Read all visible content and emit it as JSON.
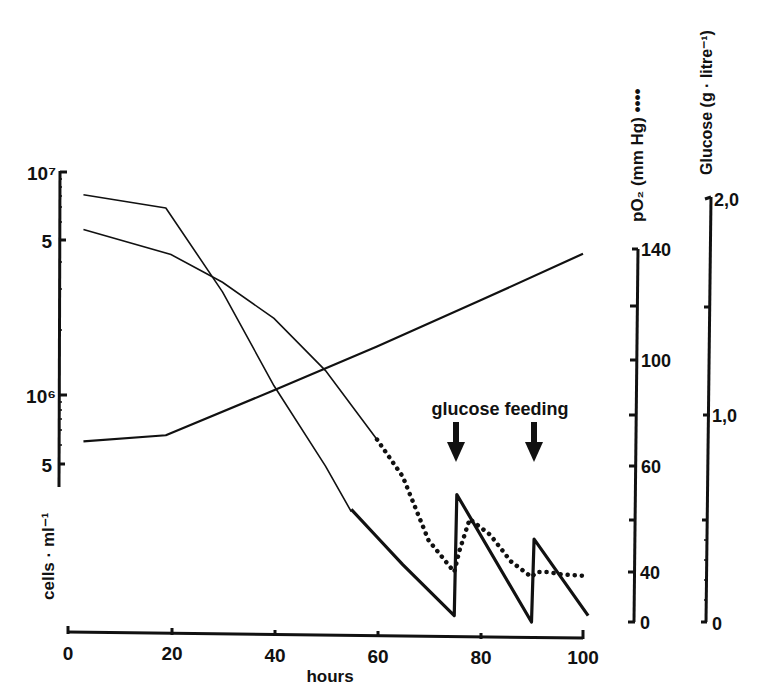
{
  "chart_data": {
    "type": "line",
    "title": "",
    "xlabel": "hours",
    "x_ticks": [
      0,
      20,
      40,
      60,
      80,
      100
    ],
    "xlim": [
      0,
      100
    ],
    "annotation": {
      "text": "glucose feeding",
      "arrows_at_hours": [
        75,
        90
      ]
    },
    "axes": {
      "left": {
        "label": "cells · ml⁻¹",
        "scale": "log",
        "ticks": [
          {
            "label": "10⁷",
            "value": 10000000
          },
          {
            "label": "5",
            "value": 5000000
          },
          {
            "label": "10⁶",
            "value": 1000000
          },
          {
            "label": "5",
            "value": 500000
          }
        ]
      },
      "right1": {
        "label": "pO₂ (mm Hg) ••••",
        "ticks": [
          {
            "label": "140",
            "value": 140
          },
          {
            "label": "100",
            "value": 100
          },
          {
            "label": "60",
            "value": 60
          },
          {
            "label": "40",
            "value": 40
          },
          {
            "label": "0",
            "value": 0
          }
        ],
        "note": "broken axis between 40 and 0"
      },
      "right2": {
        "label": "Glucose (g · litre⁻¹)",
        "ticks": [
          {
            "label": "2,0",
            "value": 2.0
          },
          {
            "label": "1,0",
            "value": 1.0
          },
          {
            "label": "0",
            "value": 0
          }
        ]
      }
    },
    "series": [
      {
        "name": "cells (growing)",
        "axis": "left",
        "style": "solid",
        "x": [
          3,
          19,
          40,
          60,
          80,
          100
        ],
        "values": [
          620000,
          660000,
          1050000,
          1650000,
          2650000,
          4300000
        ]
      },
      {
        "name": "cell curve (declining, straight then steep)",
        "axis": "left",
        "style": "solid-thin",
        "x": [
          3,
          19,
          30,
          40,
          50,
          55
        ],
        "values": [
          7900000,
          6900000,
          2900000,
          1100000,
          480000,
          300000
        ]
      },
      {
        "name": "pO2",
        "axis": "right1",
        "style": "solid-then-dotted",
        "x": [
          3,
          20,
          30,
          40,
          50,
          60,
          65,
          70,
          75,
          76,
          78,
          82,
          86,
          90,
          91,
          93,
          96,
          100
        ],
        "values": [
          147,
          138,
          128,
          115,
          96,
          70,
          58,
          46,
          40,
          44,
          50,
          47,
          42,
          36,
          40,
          40,
          38,
          37
        ]
      },
      {
        "name": "glucose",
        "axis": "right2",
        "style": "thick",
        "x": [
          55,
          60,
          65,
          70,
          75,
          75.5,
          90,
          90.5,
          101
        ],
        "values": [
          0.53,
          0.4,
          0.27,
          0.15,
          0.03,
          0.6,
          0.0,
          0.39,
          0.03
        ]
      }
    ]
  }
}
